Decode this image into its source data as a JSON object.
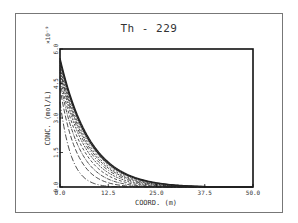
{
  "chart_data": {
    "type": "line",
    "title": "Th - 229",
    "xlabel": "COORD. (m)",
    "ylabel": "CONC. (mol/L)",
    "y_multiplier": "×10⁻⁹",
    "xlim": [
      0,
      50
    ],
    "ylim": [
      0,
      6
    ],
    "x_ticks": [
      "0.0",
      "12.5",
      "25.0",
      "37.5",
      "50.0"
    ],
    "y_ticks": [
      "0.0",
      "1.5",
      "3.0",
      "4.5",
      "6.0"
    ],
    "grid": false,
    "legend": null,
    "note": "Family of ~11 concentration profiles at successive times; each decays from x=0 toward 0 with distance, later profiles extending further.",
    "series": [
      {
        "name": "profile-1",
        "c0": 3.7,
        "decay_length_m": 3.5
      },
      {
        "name": "profile-2",
        "c0": 4.3,
        "decay_length_m": 5.0
      },
      {
        "name": "profile-3",
        "c0": 4.6,
        "decay_length_m": 6.0
      },
      {
        "name": "profile-4",
        "c0": 4.8,
        "decay_length_m": 6.8
      },
      {
        "name": "profile-5",
        "c0": 5.0,
        "decay_length_m": 7.4
      },
      {
        "name": "profile-6",
        "c0": 5.1,
        "decay_length_m": 7.9
      },
      {
        "name": "profile-7",
        "c0": 5.2,
        "decay_length_m": 8.3
      },
      {
        "name": "profile-8",
        "c0": 5.3,
        "decay_length_m": 8.6
      },
      {
        "name": "profile-9",
        "c0": 5.4,
        "decay_length_m": 8.9
      },
      {
        "name": "profile-10",
        "c0": 5.5,
        "decay_length_m": 9.1
      },
      {
        "name": "profile-11",
        "c0": 5.6,
        "decay_length_m": 9.3
      }
    ]
  }
}
